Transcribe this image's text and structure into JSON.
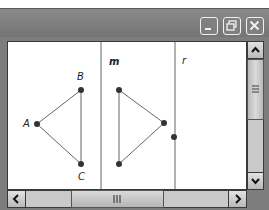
{
  "window": {
    "controls": [
      {
        "name": "minimize",
        "icon": "minimize-icon"
      },
      {
        "name": "restore",
        "icon": "restore-icon"
      },
      {
        "name": "close",
        "icon": "close-icon"
      }
    ]
  },
  "canvas": {
    "lines": [
      {
        "label": "m",
        "x": 93
      },
      {
        "label": "r",
        "x": 167
      }
    ],
    "triangle_original": {
      "points": [
        {
          "label": "A",
          "x": 29,
          "y": 82
        },
        {
          "label": "B",
          "x": 73,
          "y": 48
        },
        {
          "label": "C",
          "x": 73,
          "y": 122
        }
      ]
    },
    "triangle_reflected": {
      "points": [
        {
          "x": 111,
          "y": 48
        },
        {
          "x": 156,
          "y": 81
        },
        {
          "x": 111,
          "y": 122
        }
      ]
    },
    "point_on_r": {
      "x": 166,
      "y": 95
    },
    "colors": {
      "line": "#666666",
      "point": "#333333"
    }
  },
  "scrollbars": {
    "vertical": {
      "up_icon": "chevron-up-icon",
      "down_icon": "chevron-down-icon",
      "grip": "≡"
    },
    "horizontal": {
      "left_icon": "chevron-left-icon",
      "right_icon": "chevron-right-icon",
      "grip": "III"
    }
  }
}
